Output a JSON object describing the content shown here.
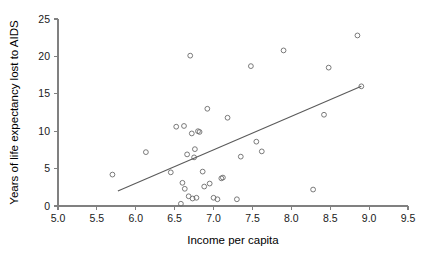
{
  "chart_data": {
    "type": "scatter",
    "title": "",
    "xlabel": "Income per capita",
    "ylabel": "Years of life expectancy lost to AIDS",
    "xlim": [
      5.0,
      9.5
    ],
    "ylim": [
      0,
      25
    ],
    "xticks": [
      "5.0",
      "5.5",
      "6.0",
      "6.5",
      "7.0",
      "7.5",
      "8.0",
      "8.5",
      "9.0",
      "9.5"
    ],
    "xtick_values": [
      5.0,
      5.5,
      6.0,
      6.5,
      7.0,
      7.5,
      8.0,
      8.5,
      9.0,
      9.5
    ],
    "yticks": [
      "0",
      "5",
      "10",
      "15",
      "20",
      "25"
    ],
    "ytick_values": [
      0,
      5,
      10,
      15,
      20,
      25
    ],
    "grid": false,
    "legend": null,
    "marker": "open-circle",
    "points": [
      [
        5.7,
        4.2
      ],
      [
        6.13,
        7.2
      ],
      [
        6.45,
        4.5
      ],
      [
        6.52,
        10.6
      ],
      [
        6.62,
        10.7
      ],
      [
        6.58,
        0.3
      ],
      [
        6.6,
        3.1
      ],
      [
        6.63,
        2.3
      ],
      [
        6.66,
        6.9
      ],
      [
        6.68,
        1.3
      ],
      [
        6.7,
        20.1
      ],
      [
        6.72,
        9.7
      ],
      [
        6.73,
        1.0
      ],
      [
        6.75,
        6.5
      ],
      [
        6.76,
        7.6
      ],
      [
        6.78,
        1.1
      ],
      [
        6.8,
        10.0
      ],
      [
        6.82,
        9.9
      ],
      [
        6.86,
        4.6
      ],
      [
        6.88,
        2.6
      ],
      [
        6.92,
        13.0
      ],
      [
        6.95,
        3.0
      ],
      [
        7.0,
        1.1
      ],
      [
        7.05,
        0.9
      ],
      [
        7.1,
        3.7
      ],
      [
        7.12,
        3.8
      ],
      [
        7.18,
        11.8
      ],
      [
        7.3,
        0.9
      ],
      [
        7.35,
        6.6
      ],
      [
        7.48,
        18.7
      ],
      [
        7.55,
        8.6
      ],
      [
        7.62,
        7.3
      ],
      [
        7.9,
        20.8
      ],
      [
        8.28,
        2.2
      ],
      [
        8.42,
        12.2
      ],
      [
        8.48,
        18.5
      ],
      [
        8.85,
        22.8
      ],
      [
        8.9,
        16.0
      ]
    ],
    "fit_line": {
      "x_start": 5.77,
      "y_start": 2.0,
      "x_end": 8.9,
      "y_end": 16.0
    }
  }
}
